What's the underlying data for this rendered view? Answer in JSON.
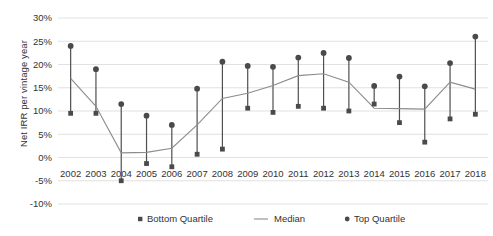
{
  "chart_data": {
    "type": "line",
    "title": "",
    "xlabel": "",
    "ylabel": "Net IRR per vintage year",
    "categories": [
      "2002",
      "2003",
      "2004",
      "2005",
      "2006",
      "2007",
      "2008",
      "2009",
      "2010",
      "2011",
      "2012",
      "2013",
      "2014",
      "2015",
      "2016",
      "2017",
      "2018"
    ],
    "ylim": [
      -10,
      30
    ],
    "ytick_labels": [
      "30%",
      "25%",
      "20%",
      "15%",
      "10%",
      "5%",
      "0%",
      "-5%",
      "-10%"
    ],
    "ytick_values": [
      30,
      25,
      20,
      15,
      10,
      5,
      0,
      -5,
      -10
    ],
    "grid": true,
    "legend_position": "bottom",
    "value_suffix": "%",
    "series": [
      {
        "name": "Bottom Quartile",
        "marker": "square",
        "color": "#4a4a4a",
        "values": [
          9.5,
          9.5,
          -5.0,
          -1.3,
          -2.0,
          0.7,
          1.8,
          10.6,
          9.7,
          11.0,
          10.6,
          10.0,
          11.5,
          7.5,
          3.3,
          8.3,
          9.3
        ]
      },
      {
        "name": "Median",
        "marker": "line",
        "color": "#8c8c8c",
        "values": [
          17.0,
          11.0,
          1.0,
          1.1,
          2.0,
          7.0,
          12.7,
          13.8,
          15.5,
          17.6,
          18.0,
          16.2,
          10.6,
          10.5,
          10.4,
          16.2,
          14.7
        ]
      },
      {
        "name": "Top Quartile",
        "marker": "circle",
        "color": "#4a4a4a",
        "values": [
          24.0,
          19.0,
          11.5,
          9.0,
          7.0,
          14.8,
          20.6,
          19.7,
          19.5,
          21.5,
          22.5,
          21.4,
          15.4,
          17.4,
          15.3,
          20.3,
          26.0
        ]
      }
    ]
  },
  "legend": {
    "items": [
      {
        "label": "Bottom Quartile",
        "marker": "square"
      },
      {
        "label": "Median",
        "marker": "line"
      },
      {
        "label": "Top Quartile",
        "marker": "circle"
      }
    ]
  },
  "axis": {
    "y_title": "Net IRR per vintage year"
  }
}
